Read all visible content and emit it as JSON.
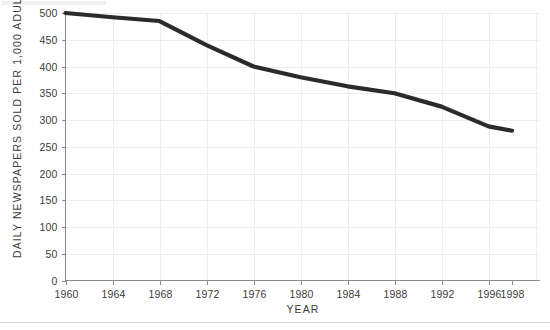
{
  "chart_data": {
    "type": "line",
    "title": "",
    "xlabel": "YEAR",
    "ylabel": "DAILY NEWSPAPERS SOLD PER 1,000 ADULTS",
    "xlim": [
      1960,
      1998
    ],
    "ylim": [
      0,
      500
    ],
    "grid": true,
    "legend": "none",
    "line_color": "#2b2b2b",
    "gridline_color": "#ededed",
    "axis_color": "#8a8a8a",
    "background_color": "#ffffff",
    "x_tick_labels": [
      "1960",
      "1964",
      "1968",
      "1972",
      "1976",
      "1980",
      "1984",
      "1988",
      "1992",
      "1996",
      "1998"
    ],
    "x_ticks": [
      1960,
      1964,
      1968,
      1972,
      1976,
      1980,
      1984,
      1988,
      1992,
      1996,
      1998
    ],
    "y_tick_labels": [
      "0",
      "50",
      "100",
      "150",
      "200",
      "250",
      "300",
      "350",
      "400",
      "450",
      "500"
    ],
    "y_ticks": [
      0,
      50,
      100,
      150,
      200,
      250,
      300,
      350,
      400,
      450,
      500
    ],
    "series": [
      {
        "name": "Daily newspapers sold per 1,000 adults",
        "x": [
          1960,
          1964,
          1968,
          1972,
          1976,
          1980,
          1984,
          1988,
          1992,
          1996,
          1998
        ],
        "values": [
          500,
          492,
          485,
          440,
          400,
          380,
          363,
          350,
          325,
          288,
          280
        ]
      }
    ]
  }
}
